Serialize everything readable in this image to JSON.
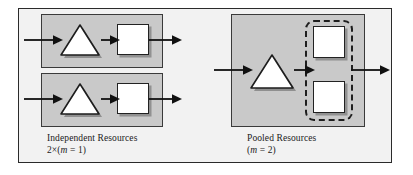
{
  "figure": {
    "colors": {
      "frame_background": "#f2f2f2",
      "frame_border": "#2b2b2b",
      "group_fill": "#c9c9c9",
      "group_border": "#3a3a3a",
      "shape_fill": "#ffffff",
      "shape_border": "#222222",
      "arrow": "#111111",
      "pool_dashed_border": "#1e1e1e",
      "text": "#1a1a1a"
    }
  },
  "left_panel": {
    "name": "independent-resources",
    "caption_title": "Independent Resources",
    "caption_formula": "2×(",
    "caption_formula_var": "m",
    "caption_formula_tail": " = 1)",
    "caption_formula_full": "2×(m = 1)",
    "groups": [
      {
        "name": "independent-group-1",
        "queue_label": "queue-triangle",
        "server_label": "server-square",
        "server_count": 1
      },
      {
        "name": "independent-group-2",
        "queue_label": "queue-triangle",
        "server_label": "server-square",
        "server_count": 1
      }
    ]
  },
  "right_panel": {
    "name": "pooled-resources",
    "caption_title": "Pooled Resources",
    "caption_formula": "(",
    "caption_formula_var": "m",
    "caption_formula_tail": " = 2)",
    "caption_formula_full": "(m = 2)",
    "group": {
      "name": "pooled-group",
      "queue_label": "queue-triangle",
      "pool_label": "pooled-server-enclosure",
      "server_count": 2
    }
  },
  "arrows": {
    "inbound_label": "arrival-arrow",
    "internal_label": "queue-to-server-arrow",
    "outbound_label": "departure-arrow"
  }
}
